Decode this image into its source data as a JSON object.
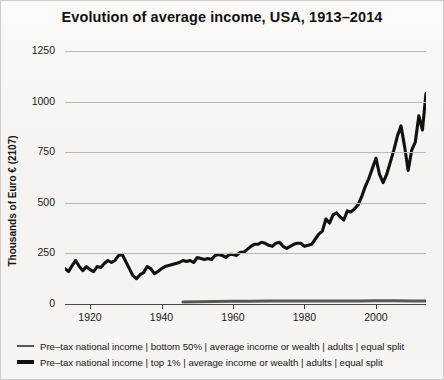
{
  "chart_data": {
    "type": "line",
    "title": "Evolution of average income, USA, 1913–2014",
    "xlabel": "",
    "ylabel": "Thousands of Euro € (2107)",
    "xlim": [
      1913,
      2014
    ],
    "ylim": [
      0,
      1250
    ],
    "ytick_labels": [
      "0",
      "250",
      "500",
      "750",
      "1000",
      "1250"
    ],
    "ytick_values": [
      0,
      250,
      500,
      750,
      1000,
      1250
    ],
    "xtick_labels": [
      "1920",
      "1940",
      "1960",
      "1980",
      "2000"
    ],
    "xtick_values": [
      1920,
      1940,
      1960,
      1980,
      2000
    ],
    "grid": true,
    "legend_position": "below",
    "series": [
      {
        "name": "Pre–tax national income | bottom 50% | average income or wealth | adults | equal split",
        "marker": "thin",
        "color": "#575757",
        "x": [
          1946,
          1950,
          1955,
          1960,
          1965,
          1970,
          1975,
          1980,
          1985,
          1990,
          1995,
          2000,
          2005,
          2010,
          2014
        ],
        "values": [
          10,
          11,
          12,
          13,
          14,
          15,
          15,
          15,
          15,
          15,
          15,
          16,
          16,
          15,
          15
        ]
      },
      {
        "name": "Pre–tax national income | top 1% | average income or wealth | adults | equal split",
        "marker": "thick",
        "color": "#111111",
        "x": [
          1913,
          1914,
          1915,
          1916,
          1917,
          1918,
          1919,
          1920,
          1921,
          1922,
          1923,
          1924,
          1925,
          1926,
          1927,
          1928,
          1929,
          1930,
          1931,
          1932,
          1933,
          1934,
          1935,
          1936,
          1937,
          1938,
          1939,
          1940,
          1941,
          1942,
          1943,
          1944,
          1945,
          1946,
          1947,
          1948,
          1949,
          1950,
          1951,
          1952,
          1953,
          1954,
          1955,
          1956,
          1957,
          1958,
          1959,
          1960,
          1961,
          1962,
          1963,
          1964,
          1965,
          1966,
          1967,
          1968,
          1969,
          1970,
          1971,
          1972,
          1973,
          1974,
          1975,
          1976,
          1977,
          1978,
          1979,
          1980,
          1981,
          1982,
          1983,
          1984,
          1985,
          1986,
          1987,
          1988,
          1989,
          1990,
          1991,
          1992,
          1993,
          1994,
          1995,
          1996,
          1997,
          1998,
          1999,
          2000,
          2001,
          2002,
          2003,
          2004,
          2005,
          2006,
          2007,
          2008,
          2009,
          2010,
          2011,
          2012,
          2013,
          2014
        ],
        "values": [
          175,
          160,
          190,
          215,
          185,
          165,
          185,
          170,
          160,
          185,
          180,
          200,
          215,
          205,
          215,
          240,
          245,
          210,
          175,
          140,
          125,
          145,
          155,
          185,
          175,
          150,
          160,
          175,
          185,
          190,
          195,
          200,
          205,
          215,
          210,
          215,
          205,
          230,
          225,
          220,
          225,
          220,
          240,
          245,
          240,
          230,
          245,
          245,
          240,
          255,
          255,
          270,
          285,
          295,
          295,
          305,
          300,
          290,
          285,
          300,
          305,
          285,
          275,
          285,
          295,
          300,
          300,
          285,
          290,
          295,
          320,
          345,
          360,
          420,
          400,
          440,
          450,
          430,
          415,
          460,
          455,
          470,
          490,
          530,
          580,
          620,
          670,
          720,
          640,
          600,
          640,
          700,
          760,
          830,
          880,
          780,
          660,
          760,
          800,
          930,
          860,
          1040
        ]
      }
    ]
  },
  "legend": {
    "items": [
      {
        "marker": "thin",
        "label": "Pre–tax national income | bottom 50% | average income or wealth | adults | equal split"
      },
      {
        "marker": "thick",
        "label": "Pre–tax national income | top 1% | average income or wealth | adults | equal split"
      }
    ]
  }
}
